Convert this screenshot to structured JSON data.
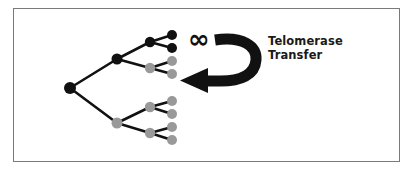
{
  "figure": {
    "caption_lines": [
      "Telomerase",
      "Transfer"
    ],
    "immortality_symbol": "∞",
    "arrow": {
      "name": "curved-transfer-arrow",
      "direction": "right-to-left",
      "color": "#111111"
    },
    "frame": {
      "border_color": "#7a7a7a",
      "background_color": "#ffffff"
    },
    "colors": {
      "black_node": "#111111",
      "gray_node": "#999999",
      "edge": "#111111",
      "text": "#1a1a1a"
    },
    "tree": {
      "type": "binary-lineage-tree",
      "description": "Cell lineage tree with black (telomerase-positive / immortal) and gray (senescent) nodes",
      "nodes": [
        {
          "id": "root",
          "x": 70,
          "y": 88,
          "r": 6.0,
          "color": "black",
          "depth": 0
        },
        {
          "id": "u1",
          "x": 117,
          "y": 59,
          "r": 5.5,
          "color": "black",
          "depth": 1
        },
        {
          "id": "l1",
          "x": 117,
          "y": 123,
          "r": 5.5,
          "color": "gray",
          "depth": 1
        },
        {
          "id": "u2a",
          "x": 150,
          "y": 42,
          "r": 5.2,
          "color": "black",
          "depth": 2
        },
        {
          "id": "u2b",
          "x": 150,
          "y": 68,
          "r": 5.2,
          "color": "gray",
          "depth": 2
        },
        {
          "id": "l2a",
          "x": 150,
          "y": 107,
          "r": 5.2,
          "color": "gray",
          "depth": 2
        },
        {
          "id": "l2b",
          "x": 150,
          "y": 133,
          "r": 5.2,
          "color": "gray",
          "depth": 2
        },
        {
          "id": "leaf1",
          "x": 172,
          "y": 35,
          "r": 5.0,
          "color": "black",
          "depth": 3
        },
        {
          "id": "leaf2",
          "x": 172,
          "y": 48,
          "r": 5.0,
          "color": "black",
          "depth": 3
        },
        {
          "id": "leaf3",
          "x": 172,
          "y": 61,
          "r": 5.0,
          "color": "gray",
          "depth": 3
        },
        {
          "id": "leaf4",
          "x": 172,
          "y": 74,
          "r": 5.0,
          "color": "gray",
          "depth": 3
        },
        {
          "id": "leaf5",
          "x": 172,
          "y": 101,
          "r": 5.0,
          "color": "gray",
          "depth": 3
        },
        {
          "id": "leaf6",
          "x": 172,
          "y": 114,
          "r": 5.0,
          "color": "gray",
          "depth": 3
        },
        {
          "id": "leaf7",
          "x": 172,
          "y": 127,
          "r": 5.0,
          "color": "gray",
          "depth": 3
        },
        {
          "id": "leaf8",
          "x": 172,
          "y": 140,
          "r": 5.0,
          "color": "gray",
          "depth": 3
        }
      ],
      "edges": [
        [
          "root",
          "u1"
        ],
        [
          "root",
          "l1"
        ],
        [
          "u1",
          "u2a"
        ],
        [
          "u1",
          "u2b"
        ],
        [
          "l1",
          "l2a"
        ],
        [
          "l1",
          "l2b"
        ],
        [
          "u2a",
          "leaf1"
        ],
        [
          "u2a",
          "leaf2"
        ],
        [
          "u2b",
          "leaf3"
        ],
        [
          "u2b",
          "leaf4"
        ],
        [
          "l2a",
          "leaf5"
        ],
        [
          "l2a",
          "leaf6"
        ],
        [
          "l2b",
          "leaf7"
        ],
        [
          "l2b",
          "leaf8"
        ]
      ]
    },
    "infinity": {
      "x": 202,
      "y": 42,
      "font_size": 26
    }
  }
}
